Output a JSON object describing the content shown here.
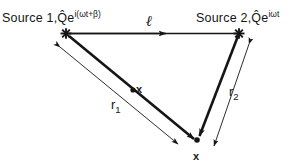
{
  "figure": {
    "name": "two-source-interference-geometry",
    "background_color": "#ffffff",
    "ink_color": "#151515",
    "width": 303,
    "height": 168
  },
  "labels": {
    "source1": {
      "text": "Source 1,",
      "amplitude": "Q",
      "base": "e",
      "exponent_open": "i(",
      "exponent_omega": "ωt+β",
      "exponent_close": ")",
      "full": "Source 1, Q̂e^{i(ωt+β)}"
    },
    "source2": {
      "text": "Source 2,",
      "amplitude": "Q",
      "base": "e",
      "exponent": "iωt",
      "full": "Source 2, Q̂e^{iωt}"
    },
    "separation": "ℓ",
    "r1": "r",
    "r1_sub": "1",
    "r2": "r",
    "r2_sub": "2",
    "field_point_mid": "x",
    "field_point_bottom": "x"
  },
  "geometry": {
    "source1_vertex": {
      "x": 66,
      "y": 33
    },
    "source2_vertex": {
      "x": 239,
      "y": 33
    },
    "field_vertex": {
      "x": 197,
      "y": 140
    },
    "baseline_arrow_tip": {
      "x": 168,
      "y": 33
    },
    "marker_style": "asterisk-star",
    "r1_ray_label": "r1 thick ray from source 1 to field point",
    "r2_ray_label": "r2 thick ray from source 2 to field point",
    "dimension_lines": [
      "r1 thin double-headed dimension line",
      "r2 thin double-headed dimension line"
    ]
  }
}
